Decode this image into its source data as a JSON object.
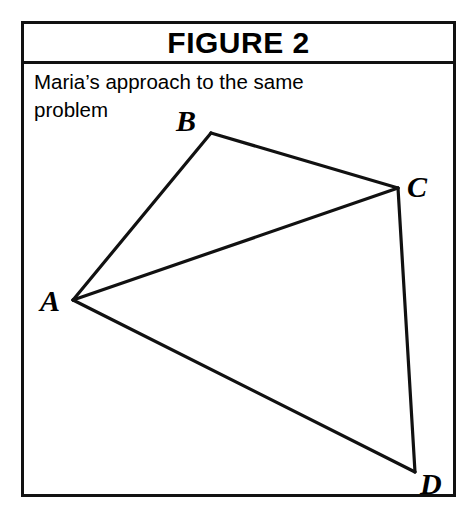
{
  "figure": {
    "title": "FIGURE 2",
    "caption": "Maria’s approach to the same problem",
    "border_color": "#111111",
    "background_color": "#ffffff",
    "line_color": "#111111"
  },
  "diagram": {
    "kind": "geometry-quadrilateral-with-diagonal",
    "vertices": [
      {
        "id": "A",
        "label": "A",
        "x": 49,
        "y": 236,
        "label_x": 16,
        "label_y": 247
      },
      {
        "id": "B",
        "label": "B",
        "x": 187,
        "y": 69,
        "label_x": 152,
        "label_y": 67
      },
      {
        "id": "C",
        "label": "C",
        "x": 374,
        "y": 124,
        "label_x": 383,
        "label_y": 133
      },
      {
        "id": "D",
        "label": "D",
        "x": 391,
        "y": 408,
        "label_x": 396,
        "label_y": 430
      }
    ],
    "edges": [
      {
        "from": "A",
        "to": "B",
        "type": "side"
      },
      {
        "from": "B",
        "to": "C",
        "type": "side"
      },
      {
        "from": "C",
        "to": "D",
        "type": "side"
      },
      {
        "from": "D",
        "to": "A",
        "type": "side"
      },
      {
        "from": "A",
        "to": "C",
        "type": "diagonal"
      }
    ]
  }
}
